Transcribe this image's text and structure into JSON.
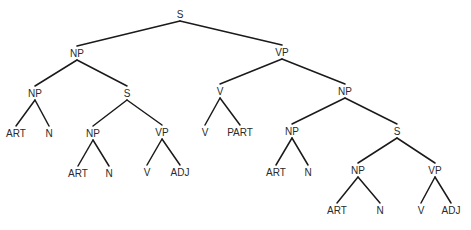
{
  "diagram": {
    "type": "parse-tree",
    "nodes": [
      {
        "id": "s0",
        "label": "S",
        "x": 180,
        "y": 14
      },
      {
        "id": "np1",
        "label": "NP",
        "x": 77,
        "y": 53
      },
      {
        "id": "vp1",
        "label": "VP",
        "x": 282,
        "y": 52
      },
      {
        "id": "np2",
        "label": "NP",
        "x": 35,
        "y": 93
      },
      {
        "id": "s1",
        "label": "S",
        "x": 127,
        "y": 93
      },
      {
        "id": "art1",
        "label": "ART",
        "x": 16,
        "y": 133
      },
      {
        "id": "n1",
        "label": "N",
        "x": 49,
        "y": 133
      },
      {
        "id": "np3",
        "label": "NP",
        "x": 93,
        "y": 133
      },
      {
        "id": "vp2",
        "label": "VP",
        "x": 162,
        "y": 132
      },
      {
        "id": "art2",
        "label": "ART",
        "x": 78,
        "y": 173
      },
      {
        "id": "n2",
        "label": "N",
        "x": 109,
        "y": 173
      },
      {
        "id": "v1",
        "label": "V",
        "x": 147,
        "y": 172
      },
      {
        "id": "adj1",
        "label": "ADJ",
        "x": 180,
        "y": 172
      },
      {
        "id": "v2",
        "label": "V",
        "x": 220,
        "y": 91
      },
      {
        "id": "v3",
        "label": "V",
        "x": 205,
        "y": 132
      },
      {
        "id": "part1",
        "label": "PART",
        "x": 240,
        "y": 132
      },
      {
        "id": "np4",
        "label": "NP",
        "x": 345,
        "y": 91
      },
      {
        "id": "np5",
        "label": "NP",
        "x": 292,
        "y": 131
      },
      {
        "id": "art3",
        "label": "ART",
        "x": 276,
        "y": 172
      },
      {
        "id": "n3",
        "label": "N",
        "x": 308,
        "y": 172
      },
      {
        "id": "s2",
        "label": "S",
        "x": 397,
        "y": 131
      },
      {
        "id": "np6",
        "label": "NP",
        "x": 358,
        "y": 170
      },
      {
        "id": "vp3",
        "label": "VP",
        "x": 435,
        "y": 170
      },
      {
        "id": "art4",
        "label": "ART",
        "x": 337,
        "y": 210
      },
      {
        "id": "n4",
        "label": "N",
        "x": 380,
        "y": 210
      },
      {
        "id": "v4",
        "label": "V",
        "x": 421,
        "y": 210
      },
      {
        "id": "adj2",
        "label": "ADJ",
        "x": 451,
        "y": 210
      }
    ],
    "edges": [
      [
        "s0",
        "np1"
      ],
      [
        "s0",
        "vp1"
      ],
      [
        "np1",
        "np2"
      ],
      [
        "np1",
        "s1"
      ],
      [
        "np2",
        "art1"
      ],
      [
        "np2",
        "n1"
      ],
      [
        "s1",
        "np3"
      ],
      [
        "s1",
        "vp2"
      ],
      [
        "np3",
        "art2"
      ],
      [
        "np3",
        "n2"
      ],
      [
        "vp2",
        "v1"
      ],
      [
        "vp2",
        "adj1"
      ],
      [
        "vp1",
        "v2"
      ],
      [
        "vp1",
        "np4"
      ],
      [
        "v2",
        "v3"
      ],
      [
        "v2",
        "part1"
      ],
      [
        "np4",
        "np5"
      ],
      [
        "np4",
        "s2"
      ],
      [
        "np5",
        "art3"
      ],
      [
        "np5",
        "n3"
      ],
      [
        "s2",
        "np6"
      ],
      [
        "s2",
        "vp3"
      ],
      [
        "np6",
        "art4"
      ],
      [
        "np6",
        "n4"
      ],
      [
        "vp3",
        "v4"
      ],
      [
        "vp3",
        "adj2"
      ]
    ]
  }
}
